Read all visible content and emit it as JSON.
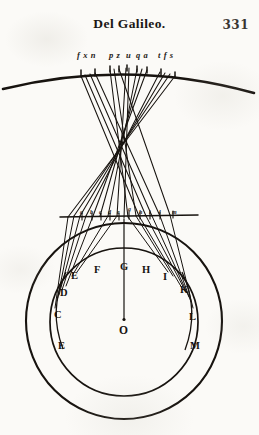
{
  "page": {
    "width": 259,
    "height": 435,
    "background_color": "#fbfaf7",
    "ink_color": "#17130f"
  },
  "header": {
    "title": "Del Galileo.",
    "folio": "331"
  },
  "figure": {
    "caption_row_note": "italic ray labels above the upper arc",
    "ray_labels": [
      {
        "text": "f x n",
        "x": 77,
        "y": 0
      },
      {
        "text": "p z",
        "x": 109,
        "y": 0
      },
      {
        "text": "u",
        "x": 126,
        "y": 0
      },
      {
        "text": "q a",
        "x": 136,
        "y": 0
      },
      {
        "text": "t f s",
        "x": 158,
        "y": 0
      }
    ],
    "upper_arc": {
      "label": "outer celestial arc",
      "start_x": 4,
      "start_y": 88,
      "end_x": 253,
      "end_y": 92,
      "apex_x": 128,
      "apex_y": 66
    },
    "chord": {
      "label": "horizontal chord at top of inner globe",
      "left_x": 62,
      "right_x": 196,
      "y": 216
    },
    "chord_labels": [
      {
        "text": "a",
        "x": 80,
        "y": 209
      },
      {
        "text": "b",
        "x": 90,
        "y": 209
      },
      {
        "text": "c",
        "x": 99,
        "y": 209
      },
      {
        "text": "d",
        "x": 108,
        "y": 209
      },
      {
        "text": "e",
        "x": 117,
        "y": 209
      },
      {
        "text": "g",
        "x": 128,
        "y": 206
      },
      {
        "text": "h",
        "x": 139,
        "y": 209
      },
      {
        "text": "i",
        "x": 149,
        "y": 209
      },
      {
        "text": "l",
        "x": 159,
        "y": 209
      },
      {
        "text": "m",
        "x": 172,
        "y": 209
      }
    ],
    "outer_circle": {
      "label": "outer sphere",
      "cx": 124,
      "cy": 321,
      "r": 98
    },
    "inner_circle": {
      "label": "inner globe",
      "cx": 124,
      "cy": 322,
      "r": 74
    },
    "center": {
      "label": "O",
      "cx": 124,
      "cy": 330
    },
    "axis": {
      "label": "vertical axis from chord to centre",
      "x": 124,
      "top_y": 218,
      "bottom_y": 318
    },
    "point_labels": [
      {
        "text": "D",
        "x": 60,
        "y": 287,
        "size": "normal"
      },
      {
        "text": "E",
        "x": 71,
        "y": 270,
        "size": "normal"
      },
      {
        "text": "F",
        "x": 94,
        "y": 264,
        "size": "normal"
      },
      {
        "text": "G",
        "x": 120,
        "y": 261,
        "size": "normal"
      },
      {
        "text": "H",
        "x": 142,
        "y": 264,
        "size": "normal"
      },
      {
        "text": "I",
        "x": 163,
        "y": 271,
        "size": "normal"
      },
      {
        "text": "K",
        "x": 180,
        "y": 284,
        "size": "normal"
      },
      {
        "text": "C",
        "x": 54,
        "y": 309,
        "size": "normal"
      },
      {
        "text": "L",
        "x": 189,
        "y": 311,
        "size": "normal"
      },
      {
        "text": "E",
        "x": 58,
        "y": 340,
        "size": "normal"
      },
      {
        "text": "M",
        "x": 190,
        "y": 340,
        "size": "normal"
      },
      {
        "text": "O",
        "x": 119,
        "y": 324,
        "size": "big"
      }
    ]
  }
}
